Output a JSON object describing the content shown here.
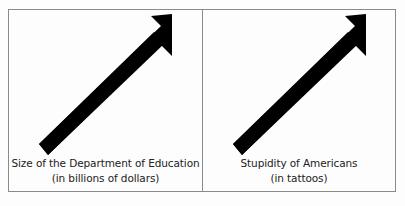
{
  "panels": [
    {
      "title": "Size of the Department of Education",
      "subtitle": "(in billions of dollars)",
      "trend": "up",
      "icon": "arrow-up-right"
    },
    {
      "title": "Stupidity of Americans",
      "subtitle": "(in tattoos)",
      "trend": "up",
      "icon": "arrow-up-right"
    }
  ],
  "footer": "",
  "colors": {
    "arrow": "#000000",
    "border": "#8a8a8a",
    "background": "#fdfdfd"
  }
}
